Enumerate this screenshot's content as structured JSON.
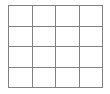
{
  "figure": {
    "kind": "grid-table",
    "title": "",
    "rows": 4,
    "columns": 4,
    "line_color": "#808080",
    "background_color": "#ffffff",
    "line_width_px": 1,
    "cells": [
      [
        "",
        "",
        "",
        ""
      ],
      [
        "",
        "",
        "",
        ""
      ],
      [
        "",
        "",
        "",
        ""
      ],
      [
        "",
        "",
        "",
        ""
      ]
    ]
  }
}
